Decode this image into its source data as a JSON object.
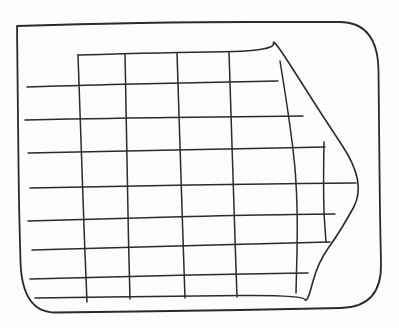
{
  "canvas": {
    "width": 399,
    "height": 328,
    "background_color": "#fdfdfd",
    "stroke_color": "#2b2b2b",
    "stroke_width": 1.5,
    "description": "Hand-drawn pen sketch: a large right-pointing arrow filled with a square grid, horizontal grid lines overshooting to the left, all inside a rough rectangular border"
  },
  "shapes": {
    "outer_border": {
      "name": "outer-border",
      "closed": true,
      "stroke_width": 1.8,
      "points": [
        [
          17,
          26
        ],
        [
          80,
          24
        ],
        [
          200,
          22
        ],
        [
          300,
          22
        ],
        [
          378,
          22
        ],
        [
          379,
          120
        ],
        [
          380,
          220
        ],
        [
          382,
          307
        ],
        [
          300,
          309
        ],
        [
          180,
          311
        ],
        [
          90,
          312
        ],
        [
          22,
          313
        ],
        [
          19,
          210
        ],
        [
          18,
          120
        ],
        [
          17,
          26
        ]
      ]
    },
    "arrow_outline": {
      "name": "arrow-outline",
      "closed": false,
      "stroke_width": 1.6,
      "points": [
        [
          78,
          55
        ],
        [
          170,
          52.5
        ],
        [
          275,
          51
        ],
        [
          272,
          36
        ],
        [
          318,
          109
        ],
        [
          367,
          183
        ],
        [
          340,
          232
        ],
        [
          318,
          262
        ],
        [
          307,
          304
        ],
        [
          303,
          295
        ],
        [
          180,
          296
        ],
        [
          35,
          298
        ]
      ]
    },
    "grid_horizontal_lines": [
      {
        "points": [
          [
            27,
            87
          ],
          [
            90,
            85
          ],
          [
            180,
            83
          ],
          [
            278,
            81
          ]
        ]
      },
      {
        "points": [
          [
            25,
            120
          ],
          [
            120,
            118
          ],
          [
            220,
            117
          ],
          [
            303,
            116
          ]
        ]
      },
      {
        "points": [
          [
            28,
            153
          ],
          [
            120,
            151
          ],
          [
            230,
            149
          ],
          [
            325,
            147
          ]
        ]
      },
      {
        "points": [
          [
            30,
            188
          ],
          [
            130,
            186
          ],
          [
            250,
            184
          ],
          [
            356,
            183
          ]
        ]
      },
      {
        "points": [
          [
            28,
            221
          ],
          [
            130,
            218
          ],
          [
            250,
            215
          ],
          [
            335,
            214
          ]
        ]
      },
      {
        "points": [
          [
            32,
            250
          ],
          [
            140,
            247
          ],
          [
            250,
            244
          ],
          [
            330,
            242
          ]
        ]
      },
      {
        "points": [
          [
            30,
            279
          ],
          [
            140,
            276
          ],
          [
            240,
            274
          ],
          [
            308,
            273
          ]
        ]
      }
    ],
    "grid_vertical_lines": [
      {
        "points": [
          [
            78,
            55
          ],
          [
            82,
            180
          ],
          [
            87,
            302
          ]
        ]
      },
      {
        "points": [
          [
            125,
            54
          ],
          [
            127,
            180
          ],
          [
            130,
            299
          ]
        ]
      },
      {
        "points": [
          [
            177,
            53
          ],
          [
            181,
            180
          ],
          [
            185,
            298
          ]
        ]
      },
      {
        "points": [
          [
            229,
            52
          ],
          [
            233,
            180
          ],
          [
            237,
            297
          ]
        ]
      },
      {
        "points": [
          [
            280,
            61
          ],
          [
            293,
            140
          ],
          [
            298,
            210
          ],
          [
            296,
            293
          ]
        ]
      },
      {
        "points": [
          [
            324,
            142
          ],
          [
            323,
            200
          ],
          [
            326,
            242
          ]
        ]
      }
    ]
  }
}
